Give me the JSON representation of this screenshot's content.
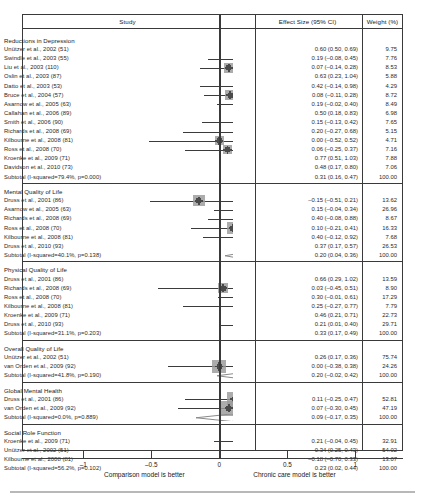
{
  "header": {
    "study": "Study",
    "effect_size": "Effect Size (95% CI)",
    "weight": "Weight (%)"
  },
  "axis": {
    "ticks": [
      -1,
      -0.5,
      0,
      0.5,
      1
    ],
    "tick_labels": [
      "–1",
      "–0.5",
      "0",
      "0.5",
      "1"
    ],
    "left_caption": "Comparison model is better",
    "right_caption": "Chronic care model is better",
    "xmin": -1.45,
    "xmax": 1.35,
    "null_value": 0
  },
  "chart_data": {
    "type": "forest",
    "title": "",
    "xlabel": "Effect Size (95% CI)",
    "ylabel": "",
    "xlim": [
      -1.45,
      1.35
    ],
    "grid": false,
    "legend": "none",
    "groups": [
      {
        "name": "Reductions in Depression",
        "rows": [
          {
            "label": "Unützer et al., 2002 (51)",
            "est": 0.6,
            "lo": 0.5,
            "hi": 0.69,
            "es_text": "0.60 (0.50, 0.69)",
            "weight": 9.75,
            "weight_text": "9.75"
          },
          {
            "label": "Swindle et al., 2003 (55)",
            "est": 0.19,
            "lo": -0.08,
            "hi": 0.45,
            "es_text": "0.19 (–0.08, 0.45)",
            "weight": 7.76,
            "weight_text": "7.76"
          },
          {
            "label": "Liu et al., 2003 (110)",
            "est": 0.07,
            "lo": -0.14,
            "hi": 0.28,
            "es_text": "0.07 (–0.14, 0.28)",
            "weight": 8.53,
            "weight_text": "8.53"
          },
          {
            "label": "Oslin et al., 2003 (87)",
            "est": 0.63,
            "lo": 0.23,
            "hi": 1.04,
            "es_text": "0.63 (0.23, 1.04)",
            "weight": 5.88,
            "weight_text": "5.88"
          },
          {
            "label": "Datto et al., 2003 (53)",
            "est": 0.42,
            "lo": -0.14,
            "hi": 0.98,
            "es_text": "0.42 (–0.14, 0.98)",
            "weight": 4.29,
            "weight_text": "4.29"
          },
          {
            "label": "Bruce et al., 2004 (57)",
            "est": 0.08,
            "lo": -0.11,
            "hi": 0.28,
            "es_text": "0.08 (–0.11, 0.28)",
            "weight": 8.72,
            "weight_text": "8.72"
          },
          {
            "label": "Asarnow et al., 2005 (63)",
            "est": 0.19,
            "lo": -0.02,
            "hi": 0.4,
            "es_text": "0.19 (–0.02, 0.40)",
            "weight": 8.49,
            "weight_text": "8.49"
          },
          {
            "label": "Callahan et al., 2006 (89)",
            "est": 0.5,
            "lo": 0.18,
            "hi": 0.83,
            "es_text": "0.50 (0.18, 0.83)",
            "weight": 6.98,
            "weight_text": "6.98"
          },
          {
            "label": "Smith et al., 2006 (90)",
            "est": 0.15,
            "lo": -0.13,
            "hi": 0.42,
            "es_text": "0.15 (–0.13, 0.42)",
            "weight": 7.65,
            "weight_text": "7.65"
          },
          {
            "label": "Richards et al., 2008 (69)",
            "est": 0.2,
            "lo": -0.27,
            "hi": 0.68,
            "es_text": "0.20 (–0.27, 0.68)",
            "weight": 5.15,
            "weight_text": "5.15"
          },
          {
            "label": "Kilbourne et al., 2008 (81)",
            "est": 0.0,
            "lo": -0.52,
            "hi": 0.52,
            "es_text": "0.00 (–0.52, 0.52)",
            "weight": 4.71,
            "weight_text": "4.71"
          },
          {
            "label": "Ross et al., 2008 (70)",
            "est": 0.06,
            "lo": -0.25,
            "hi": 0.37,
            "es_text": "0.06 (–0.25, 0.37)",
            "weight": 7.16,
            "weight_text": "7.16"
          },
          {
            "label": "Kroenke et al., 2009 (71)",
            "est": 0.77,
            "lo": 0.51,
            "hi": 1.03,
            "es_text": "0.77 (0.51, 1.03)",
            "weight": 7.88,
            "weight_text": "7.88"
          },
          {
            "label": "Davidson et al., 2010 (73)",
            "est": 0.48,
            "lo": 0.17,
            "hi": 0.8,
            "es_text": "0.48 (0.17, 0.80)",
            "weight": 7.06,
            "weight_text": "7.06"
          }
        ],
        "subtotal": {
          "label": "Subtotal (I-squared=79.4%, p=0.000)",
          "est": 0.31,
          "lo": 0.16,
          "hi": 0.47,
          "es_text": "0.31 (0.16, 0.47)",
          "weight_text": "100.00"
        }
      },
      {
        "name": "Mental Quality of Life",
        "rows": [
          {
            "label": "Druss et al., 2001 (86)",
            "est": -0.15,
            "lo": -0.51,
            "hi": 0.21,
            "es_text": "–0.15 (–0.51, 0.21)",
            "weight": 13.62,
            "weight_text": "13.62"
          },
          {
            "label": "Asarnow et al., 2005 (63)",
            "est": 0.15,
            "lo": -0.04,
            "hi": 0.34,
            "es_text": "0.15 (–0.04, 0.34)",
            "weight": 26.96,
            "weight_text": "26.96"
          },
          {
            "label": "Richards et al., 2008 (69)",
            "est": 0.4,
            "lo": -0.08,
            "hi": 0.88,
            "es_text": "0.40 (–0.08, 0.88)",
            "weight": 8.67,
            "weight_text": "8.67"
          },
          {
            "label": "Ross et al., 2008 (70)",
            "est": 0.1,
            "lo": -0.21,
            "hi": 0.41,
            "es_text": "0.10 (–0.21, 0.41)",
            "weight": 16.33,
            "weight_text": "16.33"
          },
          {
            "label": "Kilbourne et al., 2008 (81)",
            "est": 0.4,
            "lo": -0.12,
            "hi": 0.92,
            "es_text": "0.40 (–0.12, 0.92)",
            "weight": 7.68,
            "weight_text": "7.68"
          },
          {
            "label": "Druss et al., 2010 (93)",
            "est": 0.37,
            "lo": 0.17,
            "hi": 0.57,
            "es_text": "0.37 (0.17, 0.57)",
            "weight": 26.53,
            "weight_text": "26.53"
          }
        ],
        "subtotal": {
          "label": "Subtotal (I-squared=40.1%, p=0.138)",
          "est": 0.2,
          "lo": 0.04,
          "hi": 0.36,
          "es_text": "0.20 (0.04, 0.36)",
          "weight_text": "100.00"
        }
      },
      {
        "name": "Physical Quality of Life",
        "rows": [
          {
            "label": "Druss et al., 2001 (86)",
            "est": 0.66,
            "lo": 0.29,
            "hi": 1.02,
            "es_text": "0.66 (0.29, 1.02)",
            "weight": 13.59,
            "weight_text": "13.59"
          },
          {
            "label": "Richards et al., 2008 (69)",
            "est": 0.03,
            "lo": -0.45,
            "hi": 0.51,
            "es_text": "0.03 (–0.45, 0.51)",
            "weight": 8.9,
            "weight_text": "8.90"
          },
          {
            "label": "Ross et al., 2008 (70)",
            "est": 0.3,
            "lo": -0.01,
            "hi": 0.61,
            "es_text": "0.30 (–0.01, 0.61)",
            "weight": 17.29,
            "weight_text": "17.29"
          },
          {
            "label": "Kilbourne et al., 2008 (81)",
            "est": 0.25,
            "lo": -0.27,
            "hi": 0.77,
            "es_text": "0.25 (–0.27, 0.77)",
            "weight": 7.79,
            "weight_text": "7.79"
          },
          {
            "label": "Kroenke et al., 2009 (71)",
            "est": 0.46,
            "lo": 0.21,
            "hi": 0.71,
            "es_text": "0.46 (0.21, 0.71)",
            "weight": 22.73,
            "weight_text": "22.73"
          },
          {
            "label": "Druss et al., 2010 (93)",
            "est": 0.21,
            "lo": 0.01,
            "hi": 0.4,
            "es_text": "0.21 (0.01, 0.40)",
            "weight": 29.71,
            "weight_text": "29.71"
          }
        ],
        "subtotal": {
          "label": "Subtotal (I-squared=31.1%, p=0.203)",
          "est": 0.33,
          "lo": 0.17,
          "hi": 0.49,
          "es_text": "0.33 (0.17, 0.49)",
          "weight_text": "100.00"
        }
      },
      {
        "name": "Overall Quality of Life",
        "rows": [
          {
            "label": "Unützer et al., 2002 (51)",
            "est": 0.26,
            "lo": 0.17,
            "hi": 0.36,
            "es_text": "0.26 (0.17, 0.36)",
            "weight": 75.74,
            "weight_text": "75.74"
          },
          {
            "label": "van Orden et al., 2009 (92)",
            "est": 0.0,
            "lo": -0.38,
            "hi": 0.38,
            "es_text": "0.00 (–0.38, 0.38)",
            "weight": 24.26,
            "weight_text": "24.26"
          }
        ],
        "subtotal": {
          "label": "Subtotal (I-squared=41.8%, p=0.190)",
          "est": 0.2,
          "lo": -0.02,
          "hi": 0.42,
          "es_text": "0.20 (–0.02, 0.42)",
          "weight_text": "100.00"
        }
      },
      {
        "name": "Global Mental Health",
        "rows": [
          {
            "label": "Druss et al., 2001 (86)",
            "est": 0.11,
            "lo": -0.25,
            "hi": 0.47,
            "es_text": "0.11 (–0.25, 0.47)",
            "weight": 52.81,
            "weight_text": "52.81"
          },
          {
            "label": "van Orden et al., 2009 (92)",
            "est": 0.07,
            "lo": -0.3,
            "hi": 0.45,
            "es_text": "0.07 (–0.30, 0.45)",
            "weight": 47.19,
            "weight_text": "47.19"
          }
        ],
        "subtotal": {
          "label": "Subtotal (I-squared=0.0%, p=0.889)",
          "est": 0.09,
          "lo": -0.17,
          "hi": 0.35,
          "es_text": "0.09 (–0.17, 0.35)",
          "weight_text": "100.00"
        }
      },
      {
        "name": "Social Role Function",
        "rows": [
          {
            "label": "Kroenke et al., 2009 (71)",
            "est": 0.21,
            "lo": -0.04,
            "hi": 0.45,
            "es_text": "0.21 (–0.04, 0.45)",
            "weight": 32.91,
            "weight_text": "32.91"
          },
          {
            "label": "Unützer et al., 2002 (51)",
            "est": 0.34,
            "lo": 0.25,
            "hi": 0.43,
            "es_text": "0.34 (0.25, 0.43)",
            "weight": 54.02,
            "weight_text": "54.02"
          },
          {
            "label": "Kilbourne et al., 2008 (81)",
            "est": -0.18,
            "lo": -0.7,
            "hi": 0.33,
            "es_text": "–0.18 (–0.70, 0.33)",
            "weight": 13.07,
            "weight_text": "13.07"
          }
        ],
        "subtotal": {
          "label": "Subtotal (I-squared=56.2%, p=0.102)",
          "est": 0.23,
          "lo": 0.02,
          "hi": 0.44,
          "es_text": "0.23 (0.02, 0.44)",
          "weight_text": "100.00"
        }
      }
    ]
  }
}
